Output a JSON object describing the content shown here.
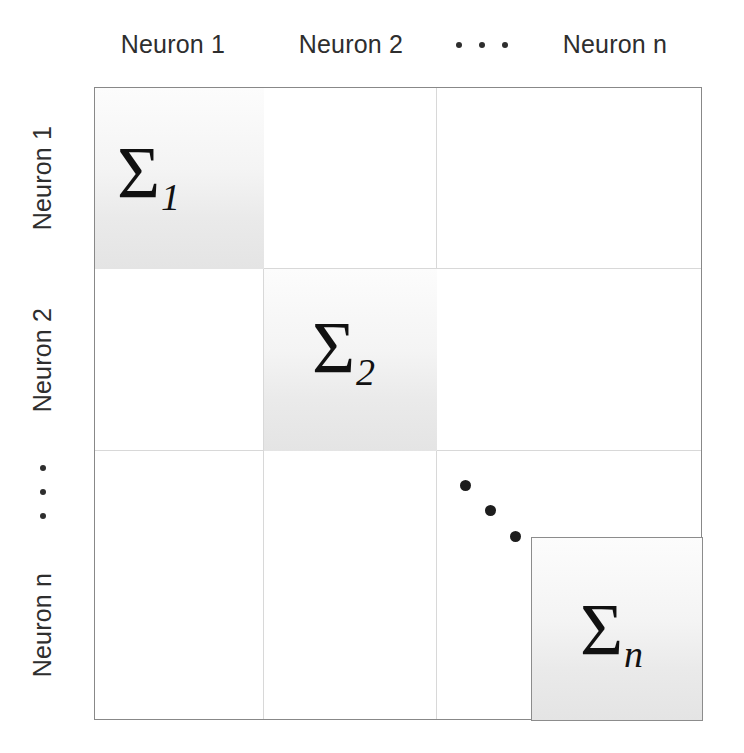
{
  "figure": {
    "type": "block-diagonal-covariance-matrix",
    "background_color": "#ffffff",
    "border_color": "#888888",
    "grid_line_color": "#d8d8d8",
    "block_shade_color": "#ededed",
    "text_color": "#2e2e2e"
  },
  "column_headers": [
    {
      "label": "Neuron 1"
    },
    {
      "label": "Neuron 2"
    },
    {
      "label": "⋯",
      "is_ellipsis": true,
      "dot_count": 3
    },
    {
      "label": "Neuron n"
    }
  ],
  "row_headers": [
    {
      "label": "Neuron 1"
    },
    {
      "label": "Neuron 2"
    },
    {
      "label": "⋮",
      "is_ellipsis": true,
      "dot_count": 3
    },
    {
      "label": "Neuron n"
    }
  ],
  "blocks": [
    {
      "symbol": "Σ",
      "subscript": "1",
      "full": "Σ₁",
      "row": "Neuron 1",
      "col": "Neuron 1"
    },
    {
      "symbol": "Σ",
      "subscript": "2",
      "full": "Σ₂",
      "row": "Neuron 2",
      "col": "Neuron 2"
    },
    {
      "symbol": "Σ",
      "subscript": "n",
      "full": "Σₙ",
      "row": "Neuron n",
      "col": "Neuron n"
    }
  ],
  "diagonal_ellipsis": {
    "dot_count": 3,
    "direction": "down-right"
  }
}
